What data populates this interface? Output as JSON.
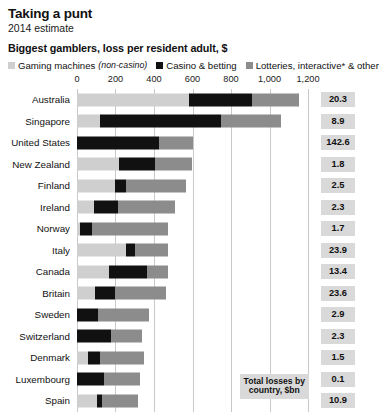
{
  "header": {
    "title": "Taking a punt",
    "subtitle": "2014 estimate"
  },
  "chart_title": "Biggest gamblers, loss per resident adult, $",
  "legend": {
    "items": [
      {
        "label": "Gaming machines",
        "note": "(non-casino)",
        "color": "#cfcfcf",
        "name": "gaming-machines"
      },
      {
        "label": "Casino & betting",
        "note": "",
        "color": "#111111",
        "name": "casino-betting"
      },
      {
        "label": "Lotteries, interactive* & other",
        "note": "",
        "color": "#8c8c8c",
        "name": "lotteries-interactive-other"
      }
    ]
  },
  "annotation": {
    "line1": "Total losses by",
    "line2": "country, $bn"
  },
  "value_column_header": "",
  "chart_data": {
    "type": "bar",
    "orientation": "horizontal",
    "stacked": true,
    "title": "Biggest gamblers, loss per resident adult, $",
    "subtitle": "2014 estimate",
    "xlabel": "Loss per resident adult, $",
    "ylabel": "",
    "xlim": [
      0,
      1200
    ],
    "xticks": [
      0,
      200,
      400,
      600,
      800,
      1000,
      1200
    ],
    "xtick_labels": [
      "0",
      "200",
      "400",
      "600",
      "800",
      "1,000",
      "1,200"
    ],
    "grid": true,
    "legend_position": "top",
    "categories": [
      "Australia",
      "Singapore",
      "United States",
      "New Zealand",
      "Finland",
      "Ireland",
      "Norway",
      "Italy",
      "Canada",
      "Britain",
      "Sweden",
      "Switzerland",
      "Denmark",
      "Luxembourg",
      "Spain"
    ],
    "series": [
      {
        "name": "Gaming machines (non-casino)",
        "color": "#cfcfcf",
        "values": [
          580,
          120,
          0,
          220,
          200,
          90,
          15,
          255,
          165,
          95,
          0,
          0,
          55,
          0,
          105
        ]
      },
      {
        "name": "Casino & betting",
        "color": "#111111",
        "values": [
          330,
          630,
          425,
          185,
          55,
          125,
          65,
          45,
          200,
          105,
          110,
          175,
          65,
          140,
          25
        ]
      },
      {
        "name": "Lotteries, interactive* & other",
        "color": "#8c8c8c",
        "values": [
          245,
          310,
          175,
          195,
          310,
          295,
          395,
          175,
          110,
          260,
          265,
          165,
          230,
          185,
          185
        ]
      }
    ],
    "side_values": {
      "label": "Total losses by country, $bn",
      "values": [
        20.3,
        8.9,
        142.6,
        1.8,
        2.5,
        2.3,
        1.7,
        23.9,
        13.4,
        23.6,
        2.9,
        2.3,
        1.5,
        0.1,
        10.9
      ],
      "display": [
        "20.3",
        "8.9",
        "142.6",
        "1.8",
        "2.5",
        "2.3",
        "1.7",
        "23.9",
        "13.4",
        "23.6",
        "2.9",
        "2.3",
        "1.5",
        "0.1",
        "10.9"
      ]
    }
  }
}
